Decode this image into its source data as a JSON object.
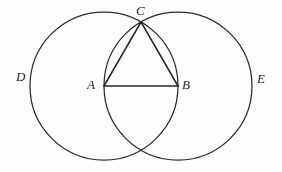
{
  "figure": {
    "background_color": "#fdfdfd",
    "stroke_color": "#2a2a2a",
    "label_color": "#1f1f1f",
    "width": 282,
    "height": 172
  },
  "labels": {
    "point_c": "C",
    "point_a": "A",
    "point_b": "B",
    "circle_d": "D",
    "circle_e": "E"
  },
  "geometry": {
    "circle_left": {
      "cx": 104,
      "cy": 86,
      "r": 74,
      "center_label": "A",
      "arc_label": "D"
    },
    "circle_right": {
      "cx": 178,
      "cy": 86,
      "r": 74,
      "center_label": "B",
      "arc_label": "E"
    },
    "point_a": {
      "x": 104,
      "y": 86
    },
    "point_b": {
      "x": 178,
      "y": 86
    },
    "point_c": {
      "x": 141,
      "y": 22
    },
    "point_lower_intersection": {
      "x": 141,
      "y": 150
    },
    "segment_ab": {
      "x1": 104,
      "y1": 86,
      "x2": 178,
      "y2": 86
    },
    "segment_ac": {
      "x1": 104,
      "y1": 86,
      "x2": 141,
      "y2": 22
    },
    "segment_bc": {
      "x1": 178,
      "y1": 86,
      "x2": 141,
      "y2": 22
    }
  }
}
